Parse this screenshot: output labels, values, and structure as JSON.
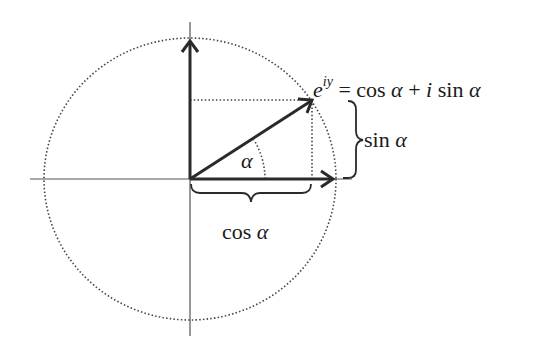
{
  "diagram": {
    "colors": {
      "background": "#ffffff",
      "stroke": "#2a2a2a",
      "axis": "#555555",
      "dotted": "#444444",
      "text": "#1a1a1a"
    },
    "geometry": {
      "origin": [
        190,
        179
      ],
      "circle_rx": 146,
      "circle_ry": 141,
      "point": [
        312,
        100
      ],
      "cos_tip": [
        333,
        179
      ],
      "sin_tip": [
        190,
        41
      ],
      "angle_arc_radius": 75
    },
    "labels": {
      "euler_base": "e",
      "euler_exponent": "iy",
      "euler_rhs_1": " = cos ",
      "euler_alpha_1": "α",
      "euler_rhs_2": " + ",
      "euler_i": "i",
      "euler_rhs_3": " sin ",
      "euler_alpha_2": "α",
      "sin_text": "sin ",
      "sin_alpha": "α",
      "cos_text": "cos ",
      "cos_alpha": "α",
      "angle": "α"
    },
    "elements": [
      "horizontal-axis",
      "vertical-axis",
      "dotted-circle",
      "vector-arrow",
      "cos-arrow",
      "sin-arrow",
      "dotted-projection-lines",
      "angle-arc",
      "sin-brace",
      "cos-brace"
    ]
  }
}
